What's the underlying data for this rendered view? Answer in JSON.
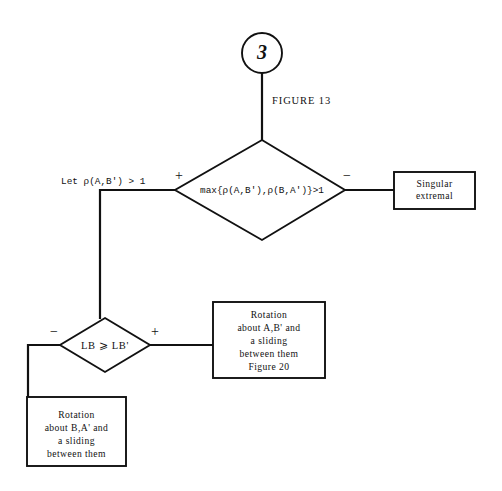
{
  "figure": {
    "caption": "FIGURE 13",
    "connector_label": "3"
  },
  "nodes": {
    "decision_top": {
      "text": "max{ρ(A,B'),ρ(B,A')}>1",
      "branch_plus": "+",
      "branch_minus": "−"
    },
    "decision_bottom": {
      "text": "LB ⩾ LB'",
      "branch_plus": "+",
      "branch_minus": "−"
    },
    "box_singular": {
      "lines": [
        "Singular",
        "extremal"
      ]
    },
    "box_rotation_ab": {
      "lines": [
        "Rotation",
        "about A,B' and",
        "a sliding",
        "between them",
        "Figure 20"
      ]
    },
    "box_rotation_ba": {
      "lines": [
        "Rotation",
        "about B,A' and",
        "a sliding",
        "between them"
      ]
    }
  },
  "annotations": {
    "precondition": "Let  ρ(A,B') > 1"
  },
  "colors": {
    "stroke": "#111111",
    "background": "#ffffff"
  }
}
